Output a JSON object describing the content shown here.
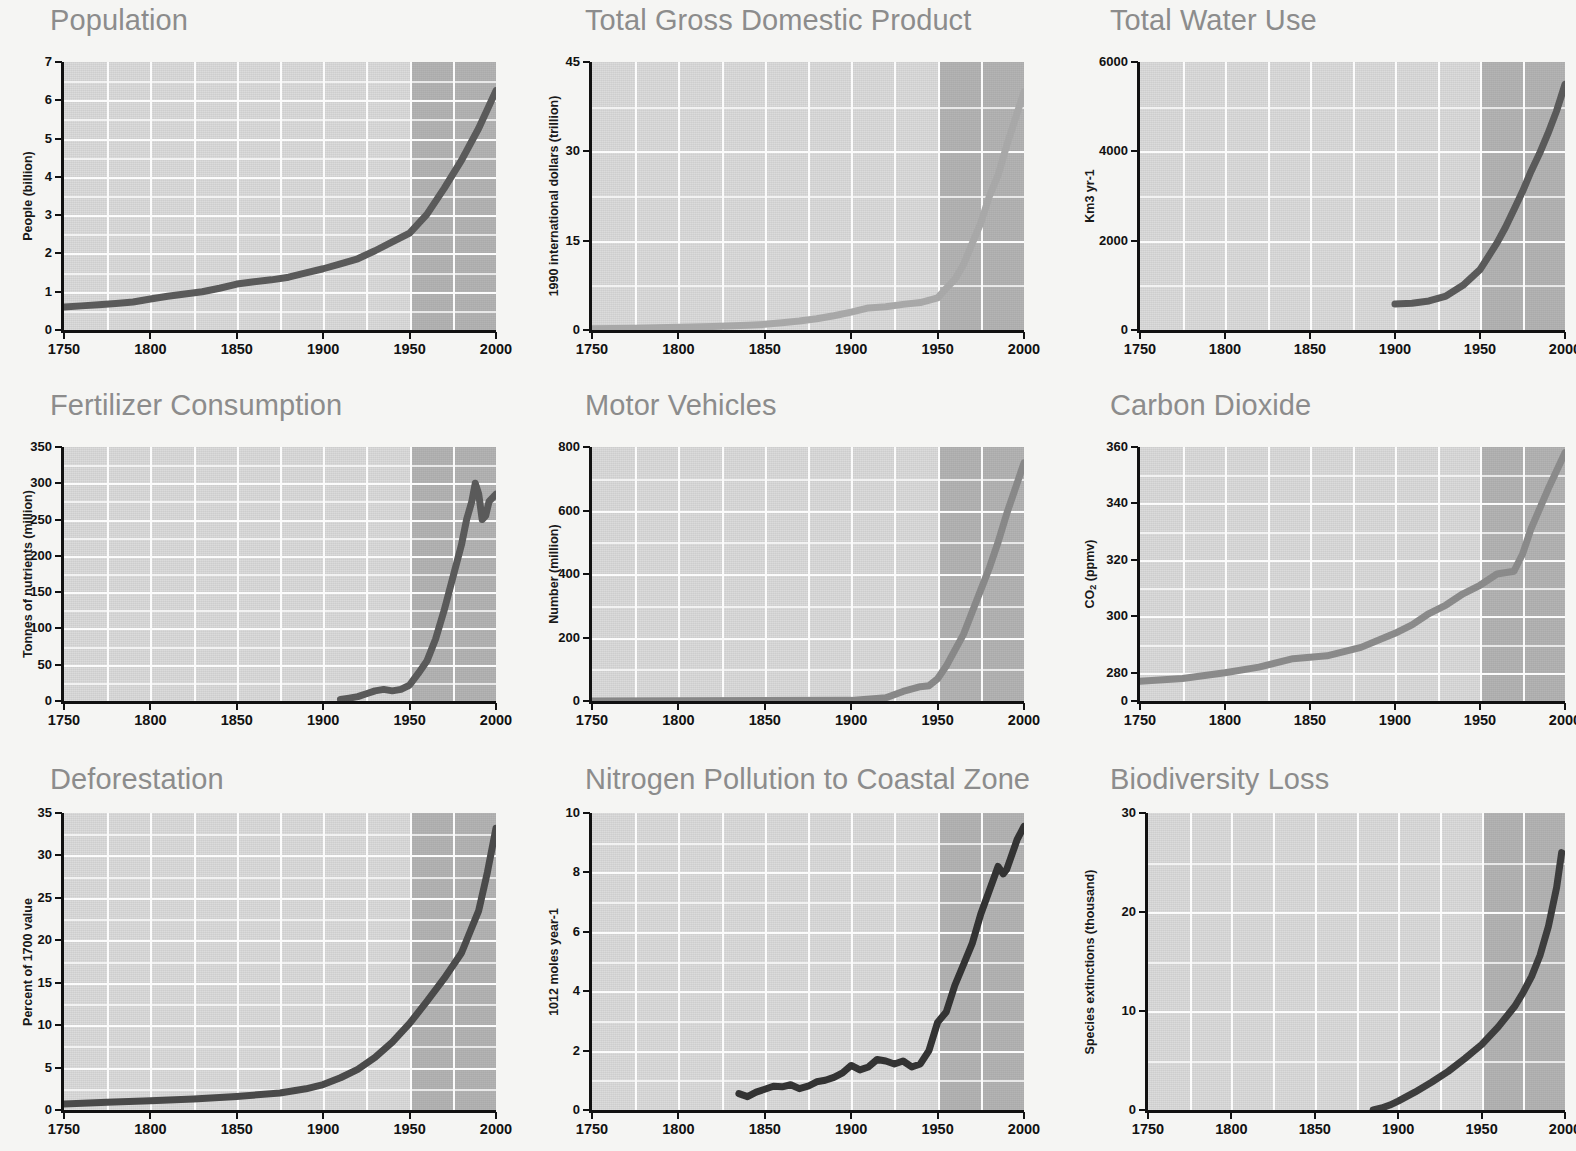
{
  "figure": {
    "background_color": "#f5f5f3",
    "plot_background_color": "#d9d9d9",
    "gridline_color": "#fbfbfb",
    "post1950_shade_color": "#a9a9a9",
    "title_color": "#8c8c8c",
    "axis_text_color": "#111111",
    "rows": 3,
    "columns": 3
  },
  "chart_data": [
    {
      "id": "population",
      "type": "line",
      "title": "Population",
      "xlabel": "",
      "ylabel": "People (billion)",
      "xlim": [
        1750,
        2000
      ],
      "ylim": [
        0,
        7
      ],
      "xticks": [
        1750,
        1800,
        1850,
        1900,
        1950,
        2000
      ],
      "yticks": [
        0,
        1,
        2,
        3,
        4,
        5,
        6,
        7
      ],
      "grid": true,
      "legend": "none",
      "shade_from": 1950,
      "line_color": "#5a5a5a",
      "x": [
        1750,
        1760,
        1770,
        1780,
        1790,
        1800,
        1810,
        1820,
        1830,
        1840,
        1850,
        1860,
        1870,
        1880,
        1890,
        1900,
        1910,
        1920,
        1930,
        1940,
        1950,
        1960,
        1970,
        1980,
        1990,
        2000
      ],
      "y": [
        0.6,
        0.63,
        0.66,
        0.69,
        0.73,
        0.81,
        0.88,
        0.94,
        1.0,
        1.09,
        1.2,
        1.26,
        1.31,
        1.38,
        1.49,
        1.6,
        1.73,
        1.86,
        2.07,
        2.3,
        2.53,
        3.02,
        3.7,
        4.43,
        5.27,
        6.25
      ],
      "annotations": [
        "post-1950 region shaded darker"
      ]
    },
    {
      "id": "gdp",
      "type": "line",
      "title": "Total Gross Domestic Product",
      "xlabel": "",
      "ylabel": "1990 international dollars (trillion)",
      "xlim": [
        1750,
        2000
      ],
      "ylim": [
        0,
        45
      ],
      "xticks": [
        1750,
        1800,
        1850,
        1900,
        1950,
        2000
      ],
      "yticks": [
        0,
        15,
        30,
        45
      ],
      "grid": true,
      "legend": "none",
      "shade_from": 1950,
      "line_color": "#a8a8a8",
      "x": [
        1750,
        1775,
        1800,
        1820,
        1840,
        1850,
        1860,
        1870,
        1880,
        1890,
        1900,
        1910,
        1920,
        1930,
        1940,
        1950,
        1955,
        1960,
        1965,
        1970,
        1975,
        1980,
        1985,
        1990,
        1995,
        2000
      ],
      "y": [
        0.2,
        0.3,
        0.45,
        0.6,
        0.8,
        0.95,
        1.2,
        1.5,
        1.9,
        2.4,
        3.0,
        3.7,
        3.9,
        4.3,
        4.6,
        5.4,
        7.0,
        8.5,
        11.0,
        14.5,
        18.0,
        22.5,
        26.0,
        31.0,
        35.5,
        40.0
      ]
    },
    {
      "id": "water",
      "type": "line",
      "title": "Total Water Use",
      "xlabel": "",
      "ylabel": "Km3 yr-1",
      "xlim": [
        1750,
        2000
      ],
      "ylim": [
        0,
        6000
      ],
      "xticks": [
        1750,
        1800,
        1850,
        1900,
        1950,
        2000
      ],
      "yticks": [
        0,
        2000,
        4000,
        6000
      ],
      "grid": true,
      "legend": "none",
      "shade_from": 1950,
      "line_color": "#5a5a5a",
      "x": [
        1900,
        1910,
        1920,
        1930,
        1940,
        1950,
        1955,
        1960,
        1965,
        1970,
        1975,
        1980,
        1985,
        1990,
        1995,
        2000
      ],
      "y": [
        580,
        600,
        650,
        760,
        1000,
        1350,
        1650,
        1950,
        2300,
        2700,
        3100,
        3550,
        3950,
        4400,
        4900,
        5500
      ]
    },
    {
      "id": "fertilizer",
      "type": "line",
      "title": "Fertilizer Consumption",
      "xlabel": "",
      "ylabel": "Tonnes of nutrients (million)",
      "xlim": [
        1750,
        2000
      ],
      "ylim": [
        0,
        350
      ],
      "xticks": [
        1750,
        1800,
        1850,
        1900,
        1950,
        2000
      ],
      "yticks": [
        0,
        50,
        100,
        150,
        200,
        250,
        300,
        350
      ],
      "grid": true,
      "legend": "none",
      "shade_from": 1950,
      "line_color": "#5a5a5a",
      "x": [
        1910,
        1915,
        1920,
        1925,
        1930,
        1935,
        1940,
        1945,
        1950,
        1955,
        1960,
        1965,
        1970,
        1975,
        1980,
        1983,
        1986,
        1988,
        1990,
        1992,
        1994,
        1996,
        2000
      ],
      "y": [
        2,
        4,
        6,
        10,
        14,
        16,
        14,
        16,
        22,
        38,
        55,
        85,
        125,
        170,
        215,
        250,
        275,
        300,
        285,
        250,
        255,
        275,
        285
      ]
    },
    {
      "id": "motor_vehicles",
      "type": "line",
      "title": "Motor Vehicles",
      "xlabel": "",
      "ylabel": "Number (million)",
      "xlim": [
        1750,
        2000
      ],
      "ylim": [
        0,
        800
      ],
      "xticks": [
        1750,
        1800,
        1850,
        1900,
        1950,
        2000
      ],
      "yticks": [
        0,
        200,
        400,
        600,
        800
      ],
      "grid": true,
      "legend": "none",
      "shade_from": 1950,
      "line_color": "#888888",
      "x": [
        1750,
        1900,
        1920,
        1930,
        1940,
        1945,
        1950,
        1955,
        1960,
        1965,
        1970,
        1975,
        1980,
        1985,
        1990,
        1995,
        2000
      ],
      "y": [
        0,
        2,
        10,
        30,
        45,
        48,
        70,
        110,
        160,
        210,
        280,
        350,
        420,
        500,
        590,
        670,
        750
      ]
    },
    {
      "id": "carbon_dioxide",
      "type": "line",
      "title": "Carbon Dioxide",
      "xlabel": "",
      "ylabel": "CO2 (ppmv)",
      "ylabel_sub": "2",
      "xlim": [
        1750,
        2000
      ],
      "ylim": [
        270,
        360
      ],
      "xticks": [
        1750,
        1800,
        1850,
        1900,
        1950,
        2000
      ],
      "yticks": [
        0,
        280,
        300,
        320,
        340,
        360
      ],
      "grid": true,
      "legend": "none",
      "shade_from": 1950,
      "line_color": "#8a8a8a",
      "x": [
        1750,
        1775,
        1800,
        1820,
        1840,
        1860,
        1880,
        1900,
        1910,
        1920,
        1930,
        1940,
        1950,
        1960,
        1970,
        1975,
        1980,
        1990,
        2000
      ],
      "y": [
        277,
        278,
        280,
        282,
        285,
        286,
        289,
        294,
        297,
        301,
        304,
        308,
        311,
        315,
        316,
        322,
        331,
        345,
        358
      ]
    },
    {
      "id": "deforestation",
      "type": "line",
      "title": "Deforestation",
      "xlabel": "",
      "ylabel": "Percent of 1700 value",
      "xlim": [
        1750,
        2000
      ],
      "ylim": [
        0,
        35
      ],
      "xticks": [
        1750,
        1800,
        1850,
        1900,
        1950,
        2000
      ],
      "yticks": [
        0,
        5,
        10,
        15,
        20,
        25,
        30,
        35
      ],
      "grid": true,
      "legend": "none",
      "shade_from": 1950,
      "line_color": "#4a4a4a",
      "x": [
        1750,
        1775,
        1800,
        1825,
        1850,
        1875,
        1890,
        1900,
        1910,
        1920,
        1930,
        1940,
        1950,
        1960,
        1970,
        1980,
        1985,
        1990,
        1995,
        2000
      ],
      "y": [
        0.7,
        0.9,
        1.1,
        1.3,
        1.6,
        2.0,
        2.5,
        3.0,
        3.8,
        4.8,
        6.2,
        8.0,
        10.2,
        12.8,
        15.5,
        18.5,
        21.0,
        23.5,
        28.0,
        33.2
      ]
    },
    {
      "id": "nitrogen",
      "type": "line",
      "title": "Nitrogen Pollution to Coastal Zone",
      "xlabel": "",
      "ylabel": "1012 moles year-1",
      "xlim": [
        1750,
        2000
      ],
      "ylim": [
        0,
        10
      ],
      "xticks": [
        1750,
        1800,
        1850,
        1900,
        1950,
        2000
      ],
      "yticks": [
        0,
        2,
        4,
        6,
        8,
        10
      ],
      "grid": true,
      "legend": "none",
      "shade_from": 1950,
      "line_color": "#333333",
      "x": [
        1835,
        1840,
        1845,
        1850,
        1855,
        1860,
        1865,
        1870,
        1875,
        1880,
        1885,
        1890,
        1895,
        1900,
        1905,
        1910,
        1915,
        1920,
        1925,
        1930,
        1935,
        1940,
        1945,
        1950,
        1955,
        1960,
        1965,
        1970,
        1975,
        1980,
        1985,
        1988,
        1990,
        1993,
        1996,
        2000
      ],
      "y": [
        0.55,
        0.45,
        0.6,
        0.7,
        0.8,
        0.78,
        0.85,
        0.72,
        0.8,
        0.95,
        1.0,
        1.1,
        1.25,
        1.5,
        1.35,
        1.45,
        1.7,
        1.65,
        1.55,
        1.65,
        1.45,
        1.55,
        2.0,
        2.95,
        3.3,
        4.2,
        4.9,
        5.6,
        6.6,
        7.4,
        8.2,
        7.95,
        8.1,
        8.6,
        9.1,
        9.55
      ]
    },
    {
      "id": "biodiversity",
      "type": "line",
      "title": "Biodiversity Loss",
      "xlabel": "",
      "ylabel": "Species extinctions (thousand)",
      "xlim": [
        1750,
        2000
      ],
      "ylim": [
        0,
        30
      ],
      "xticks": [
        1750,
        1800,
        1850,
        1900,
        1950,
        2000
      ],
      "yticks": [
        0,
        10,
        20,
        30
      ],
      "grid": true,
      "legend": "none",
      "shade_from": 1950,
      "line_color": "#3d3d3d",
      "x": [
        1885,
        1890,
        1895,
        1900,
        1910,
        1920,
        1930,
        1940,
        1950,
        1960,
        1970,
        1975,
        1980,
        1985,
        1990,
        1995,
        1998
      ],
      "y": [
        0.0,
        0.2,
        0.5,
        0.9,
        1.8,
        2.8,
        3.9,
        5.2,
        6.6,
        8.4,
        10.5,
        11.9,
        13.5,
        15.6,
        18.5,
        22.5,
        26.0
      ]
    }
  ]
}
